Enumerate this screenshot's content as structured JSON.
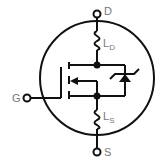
{
  "diagram": {
    "terminals": {
      "drain": "D",
      "gate": "G",
      "source": "S"
    },
    "inductors": {
      "drain": {
        "main": "L",
        "sub": "D"
      },
      "source": {
        "main": "L",
        "sub": "S"
      }
    },
    "colors": {
      "stroke": "#111111",
      "label": "#777777"
    }
  }
}
